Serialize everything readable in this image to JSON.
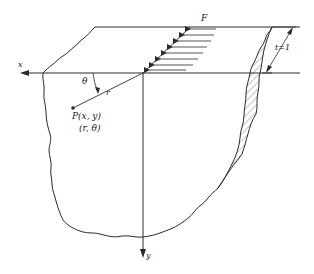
{
  "diagram": {
    "labels": {
      "x_axis": "x",
      "y_axis": "y",
      "force": "F",
      "thickness": "t=1",
      "angle": "θ",
      "radius": "r",
      "point_cartesian": "P(x, y)",
      "point_polar": "(r, θ)"
    },
    "colors": {
      "line": "#2a2a2a",
      "background": "#ffffff",
      "hatch": "#555555"
    }
  }
}
